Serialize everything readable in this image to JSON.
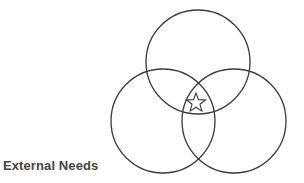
{
  "diagram": {
    "type": "venn",
    "label": "External Needs",
    "stroke_color": "#3a3a3a",
    "text_color": "#444444",
    "circles": [
      {
        "id": "top",
        "cx": 198,
        "cy": 62,
        "r": 52
      },
      {
        "id": "left",
        "cx": 163,
        "cy": 121,
        "r": 52
      },
      {
        "id": "right",
        "cx": 234,
        "cy": 121,
        "r": 52
      }
    ],
    "center_marker": {
      "icon": "star-icon",
      "cx": 196,
      "cy": 103,
      "r_outer": 10,
      "r_inner": 4.2
    }
  }
}
